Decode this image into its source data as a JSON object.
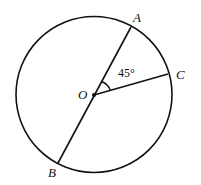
{
  "diagram": {
    "type": "circle-geometry",
    "center": {
      "label": "O",
      "x": 94,
      "y": 94
    },
    "radius": 78,
    "points": [
      {
        "label": "A",
        "x": 131,
        "y": 27,
        "label_x": 133,
        "label_y": 22
      },
      {
        "label": "B",
        "x": 58,
        "y": 163,
        "label_x": 48,
        "label_y": 177
      },
      {
        "label": "C",
        "x": 168,
        "y": 74,
        "label_x": 176,
        "label_y": 79
      }
    ],
    "segments": [
      "AB (diameter through O)",
      "OC"
    ],
    "angle": {
      "vertex": "O",
      "between": [
        "A",
        "C"
      ],
      "label": "45°"
    },
    "stroke_color": "#111111"
  }
}
